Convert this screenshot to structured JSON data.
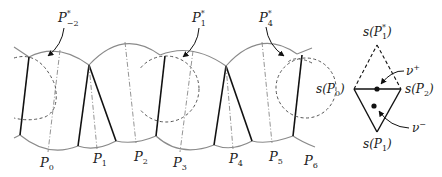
{
  "figure": {
    "left_panel": {
      "top_labels": [
        {
          "base": "P",
          "sub": "−2",
          "sup": "*"
        },
        {
          "base": "P",
          "sub": "1",
          "sup": "*"
        },
        {
          "base": "P",
          "sub": "4",
          "sup": "*"
        }
      ],
      "bottom_labels": [
        {
          "base": "P",
          "sub": "0"
        },
        {
          "base": "P",
          "sub": "1"
        },
        {
          "base": "P",
          "sub": "2"
        },
        {
          "base": "P",
          "sub": "3"
        },
        {
          "base": "P",
          "sub": "4"
        },
        {
          "base": "P",
          "sub": "5"
        },
        {
          "base": "P",
          "sub": "6"
        }
      ]
    },
    "right_panel": {
      "top_vertex": {
        "pre": "s(",
        "base": "P",
        "sub": "1",
        "sup": "*",
        "post": ")"
      },
      "left_vertex": {
        "pre": "s(",
        "base": "P",
        "sub": "0",
        "post": ")"
      },
      "right_vertex": {
        "pre": "s(",
        "base": "P",
        "sub": "2",
        "post": ")"
      },
      "bottom_vertex": {
        "pre": "s(",
        "base": "P",
        "sub": "1",
        "post": ")"
      },
      "nu_plus": {
        "base": "ν",
        "sup": "+"
      },
      "nu_minus": {
        "base": "ν",
        "sup": "−"
      }
    },
    "colors": {
      "arc": "#8a8a8a",
      "solid": "#111111",
      "dashed": "#555555",
      "dashdot": "#888888"
    }
  }
}
